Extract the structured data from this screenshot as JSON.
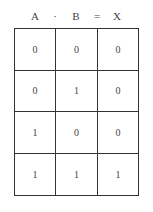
{
  "header": {
    "symbols": [
      {
        "text": "A",
        "x": 21
      },
      {
        "text": "·",
        "x": 41
      },
      {
        "text": "B",
        "x": 62
      },
      {
        "text": "=",
        "x": 83
      },
      {
        "text": "X",
        "x": 103
      }
    ]
  },
  "truth_table": {
    "columns": [
      "A",
      "B",
      "X"
    ],
    "rows": [
      [
        "0",
        "0",
        "0"
      ],
      [
        "0",
        "1",
        "0"
      ],
      [
        "1",
        "0",
        "0"
      ],
      [
        "1",
        "1",
        "1"
      ]
    ]
  }
}
